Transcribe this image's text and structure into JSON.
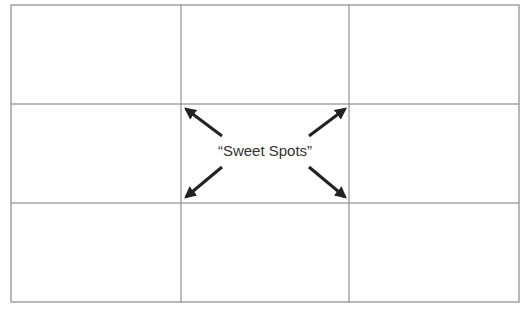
{
  "diagram": {
    "label": "“Sweet Spots”",
    "colors": {
      "background": "#ffffff",
      "grid_line": "#7a7a7a",
      "arrow": "#222222",
      "text": "#333333"
    },
    "grid": {
      "rows": 3,
      "cols": 3,
      "outer": {
        "left": 11,
        "top": 5,
        "right": 519,
        "bottom": 302
      },
      "vertical_lines_x": [
        181,
        349
      ],
      "horizontal_lines_y": [
        104,
        203
      ]
    },
    "arrows": [
      {
        "name": "top-left",
        "from": [
          222,
          136
        ],
        "to": [
          185,
          108
        ]
      },
      {
        "name": "top-right",
        "from": [
          309,
          136
        ],
        "to": [
          346,
          108
        ]
      },
      {
        "name": "bottom-left",
        "from": [
          222,
          167
        ],
        "to": [
          185,
          198
        ]
      },
      {
        "name": "bottom-right",
        "from": [
          309,
          167
        ],
        "to": [
          346,
          198
        ]
      }
    ]
  }
}
